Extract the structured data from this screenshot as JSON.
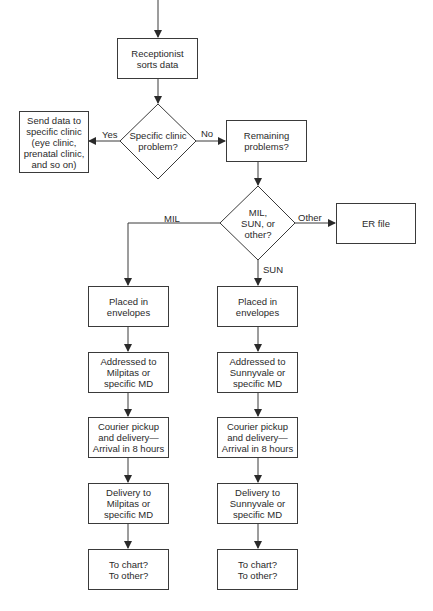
{
  "flowchart": {
    "start": {
      "label": "Receptionist\nsorts data"
    },
    "decision1": {
      "label": "Specific clinic\nproblem?",
      "yes_label": "Yes",
      "no_label": "No"
    },
    "send_clinic": {
      "label": "Send data to\nspecific clinic\n(eye clinic,\nprenatal clinic,\nand so on)"
    },
    "remaining": {
      "label": "Remaining\nproblems?"
    },
    "decision2": {
      "label": "MIL,\nSUN, or\nother?",
      "mil_label": "MIL",
      "sun_label": "SUN",
      "other_label": "Other"
    },
    "er_file": {
      "label": "ER file"
    },
    "mil_column": [
      {
        "label": "Placed in\nenvelopes"
      },
      {
        "label": "Addressed to\nMilpitas or\nspecific MD"
      },
      {
        "label": "Courier pickup\nand delivery—\nArrival in 8 hours"
      },
      {
        "label": "Delivery to\nMilpitas or\nspecific MD"
      },
      {
        "label": "To chart?\nTo other?"
      }
    ],
    "sun_column": [
      {
        "label": "Placed in\nenvelopes"
      },
      {
        "label": "Addressed to\nSunnyvale or\nspecific MD"
      },
      {
        "label": "Courier pickup\nand delivery—\nArrival in 8 hours"
      },
      {
        "label": "Delivery to\nSunnyvale or\nspecific MD"
      },
      {
        "label": "To chart?\nTo other?"
      }
    ]
  }
}
